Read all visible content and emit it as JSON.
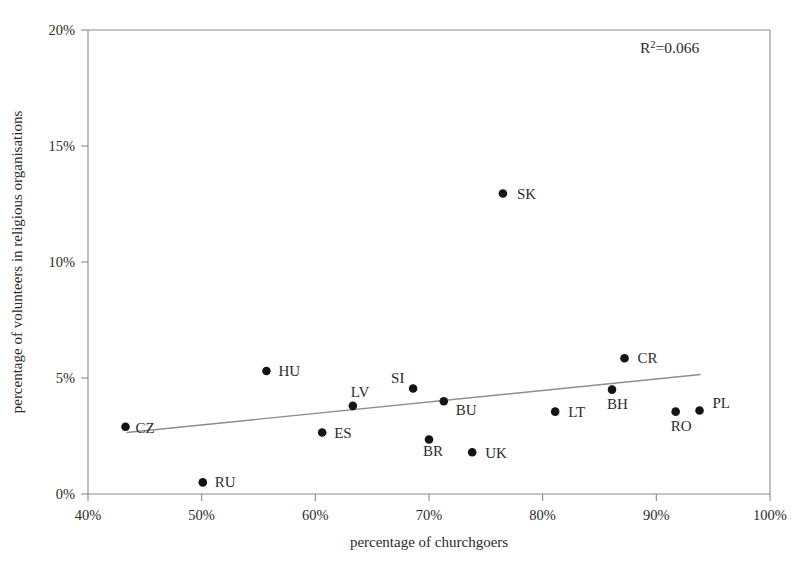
{
  "chart_data": {
    "type": "scatter",
    "title": "",
    "xlabel": "percentage of churchgoers",
    "ylabel": "percentage of volunteers in religious organisations",
    "xlim": [
      40,
      100
    ],
    "ylim": [
      0,
      20
    ],
    "x_ticks": [
      "40%",
      "50%",
      "60%",
      "70%",
      "80%",
      "90%",
      "100%"
    ],
    "x_tick_values": [
      40,
      50,
      60,
      70,
      80,
      90,
      100
    ],
    "y_ticks": [
      "0%",
      "5%",
      "10%",
      "15%",
      "20%"
    ],
    "y_tick_values": [
      0,
      5,
      10,
      15,
      20
    ],
    "grid": false,
    "legend": "none",
    "annotation": {
      "r2_prefix": "R",
      "r2_exponent": "2",
      "r2_value": "=0.066"
    },
    "points": [
      {
        "label": "CZ",
        "x": 43.3,
        "y": 2.9,
        "lx": 10,
        "ly": 6
      },
      {
        "label": "RU",
        "x": 50.1,
        "y": 0.5,
        "lx": 12,
        "ly": 5
      },
      {
        "label": "HU",
        "x": 55.7,
        "y": 5.3,
        "lx": 12,
        "ly": 5
      },
      {
        "label": "ES",
        "x": 60.6,
        "y": 2.65,
        "lx": 12,
        "ly": 5
      },
      {
        "label": "LV",
        "x": 63.3,
        "y": 3.8,
        "lx": -2,
        "ly": -9
      },
      {
        "label": "SI",
        "x": 68.6,
        "y": 4.55,
        "lx": -22,
        "ly": -5
      },
      {
        "label": "BR",
        "x": 70.0,
        "y": 2.35,
        "lx": -6,
        "ly": 17
      },
      {
        "label": "BU",
        "x": 71.3,
        "y": 4.0,
        "lx": 12,
        "ly": 14
      },
      {
        "label": "UK",
        "x": 73.8,
        "y": 1.8,
        "lx": 13,
        "ly": 6
      },
      {
        "label": "SK",
        "x": 76.5,
        "y": 12.95,
        "lx": 14,
        "ly": 5
      },
      {
        "label": "LT",
        "x": 81.1,
        "y": 3.55,
        "lx": 13,
        "ly": 5
      },
      {
        "label": "BH",
        "x": 86.1,
        "y": 4.5,
        "lx": -5,
        "ly": 19
      },
      {
        "label": "CR",
        "x": 87.2,
        "y": 5.85,
        "lx": 13,
        "ly": 5
      },
      {
        "label": "RO",
        "x": 91.7,
        "y": 3.55,
        "lx": -5,
        "ly": 19
      },
      {
        "label": "PL",
        "x": 93.8,
        "y": 3.6,
        "lx": 13,
        "ly": -2
      }
    ],
    "trendline": {
      "x_start": 43.4,
      "y_start": 2.65,
      "x_end": 93.9,
      "y_end": 5.15
    }
  }
}
